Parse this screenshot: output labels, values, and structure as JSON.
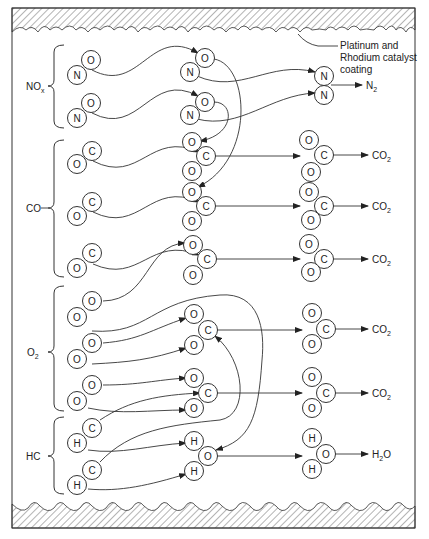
{
  "diagram": {
    "type": "catalytic-converter-reactions",
    "catalyst_label_line1": "Platinum and",
    "catalyst_label_line2": "Rhodium catalyst",
    "catalyst_label_line3": "coating",
    "groups": {
      "nox": {
        "label": "NO",
        "sub": "x"
      },
      "co": {
        "label": "CO",
        "sub": ""
      },
      "o2": {
        "label": "O",
        "sub": "2"
      },
      "hc": {
        "label": "HC",
        "sub": ""
      }
    },
    "products": [
      {
        "id": "n2",
        "label": "N",
        "sub": "2"
      },
      {
        "id": "co2_1",
        "label": "CO",
        "sub": "2"
      },
      {
        "id": "co2_2",
        "label": "CO",
        "sub": "2"
      },
      {
        "id": "co2_3",
        "label": "CO",
        "sub": "2"
      },
      {
        "id": "co2_4",
        "label": "CO",
        "sub": "2"
      },
      {
        "id": "co2_5",
        "label": "CO",
        "sub": "2"
      },
      {
        "id": "h2o",
        "label": "H",
        "sub": "2",
        "suffix": "O"
      }
    ],
    "atoms": {
      "left": [
        {
          "el": "O",
          "x": 91,
          "y": 60
        },
        {
          "el": "N",
          "x": 77,
          "y": 75
        },
        {
          "el": "O",
          "x": 91,
          "y": 103
        },
        {
          "el": "N",
          "x": 77,
          "y": 118
        },
        {
          "el": "C",
          "x": 92,
          "y": 151
        },
        {
          "el": "O",
          "x": 77,
          "y": 164
        },
        {
          "el": "C",
          "x": 92,
          "y": 202
        },
        {
          "el": "O",
          "x": 77,
          "y": 216
        },
        {
          "el": "C",
          "x": 92,
          "y": 253
        },
        {
          "el": "O",
          "x": 77,
          "y": 268
        },
        {
          "el": "O",
          "x": 92,
          "y": 301
        },
        {
          "el": "O",
          "x": 77,
          "y": 317
        },
        {
          "el": "O",
          "x": 92,
          "y": 343
        },
        {
          "el": "O",
          "x": 77,
          "y": 359
        },
        {
          "el": "O",
          "x": 92,
          "y": 385
        },
        {
          "el": "O",
          "x": 77,
          "y": 401
        },
        {
          "el": "C",
          "x": 92,
          "y": 428
        },
        {
          "el": "H",
          "x": 77,
          "y": 443
        },
        {
          "el": "C",
          "x": 92,
          "y": 470
        },
        {
          "el": "H",
          "x": 77,
          "y": 485
        }
      ],
      "middle": [
        {
          "el": "O",
          "x": 205,
          "y": 58
        },
        {
          "el": "N",
          "x": 190,
          "y": 72
        },
        {
          "el": "O",
          "x": 205,
          "y": 102
        },
        {
          "el": "N",
          "x": 190,
          "y": 115
        },
        {
          "el": "O",
          "x": 192,
          "y": 142
        },
        {
          "el": "C",
          "x": 206,
          "y": 156
        },
        {
          "el": "O",
          "x": 192,
          "y": 171
        },
        {
          "el": "O",
          "x": 192,
          "y": 192
        },
        {
          "el": "C",
          "x": 206,
          "y": 206
        },
        {
          "el": "O",
          "x": 192,
          "y": 221
        },
        {
          "el": "O",
          "x": 193,
          "y": 245
        },
        {
          "el": "C",
          "x": 207,
          "y": 259
        },
        {
          "el": "O",
          "x": 193,
          "y": 275
        },
        {
          "el": "O",
          "x": 194,
          "y": 314
        },
        {
          "el": "C",
          "x": 208,
          "y": 330
        },
        {
          "el": "O",
          "x": 194,
          "y": 345
        },
        {
          "el": "O",
          "x": 194,
          "y": 378
        },
        {
          "el": "C",
          "x": 208,
          "y": 393
        },
        {
          "el": "O",
          "x": 194,
          "y": 408
        },
        {
          "el": "H",
          "x": 194,
          "y": 441
        },
        {
          "el": "O",
          "x": 208,
          "y": 456
        },
        {
          "el": "H",
          "x": 194,
          "y": 471
        }
      ],
      "right": [
        {
          "el": "N",
          "x": 324,
          "y": 76
        },
        {
          "el": "N",
          "x": 324,
          "y": 95
        },
        {
          "el": "O",
          "x": 309,
          "y": 140
        },
        {
          "el": "C",
          "x": 324,
          "y": 155
        },
        {
          "el": "O",
          "x": 311,
          "y": 172
        },
        {
          "el": "O",
          "x": 309,
          "y": 192
        },
        {
          "el": "C",
          "x": 324,
          "y": 206
        },
        {
          "el": "O",
          "x": 311,
          "y": 220
        },
        {
          "el": "O",
          "x": 309,
          "y": 244
        },
        {
          "el": "C",
          "x": 324,
          "y": 259
        },
        {
          "el": "O",
          "x": 311,
          "y": 272
        },
        {
          "el": "O",
          "x": 312,
          "y": 313
        },
        {
          "el": "C",
          "x": 326,
          "y": 329
        },
        {
          "el": "O",
          "x": 312,
          "y": 344
        },
        {
          "el": "O",
          "x": 312,
          "y": 377
        },
        {
          "el": "C",
          "x": 326,
          "y": 393
        },
        {
          "el": "O",
          "x": 312,
          "y": 408
        },
        {
          "el": "H",
          "x": 312,
          "y": 438
        },
        {
          "el": "O",
          "x": 326,
          "y": 454
        },
        {
          "el": "H",
          "x": 312,
          "y": 469
        }
      ]
    },
    "colors": {
      "stroke": "#333333",
      "background": "#ffffff"
    }
  }
}
